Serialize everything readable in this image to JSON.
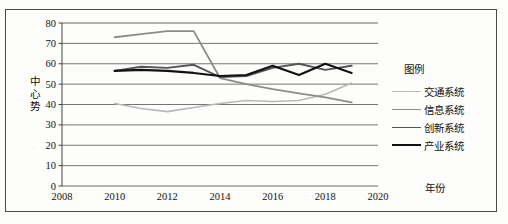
{
  "chart_data": {
    "type": "line",
    "title": "",
    "xlabel": "年份",
    "ylabel": "中心势",
    "xlim": [
      2008,
      2020
    ],
    "ylim": [
      0,
      80
    ],
    "xticks": [
      "2008",
      "2010",
      "2012",
      "2014",
      "2016",
      "2018",
      "2020"
    ],
    "yticks": [
      "0",
      "10",
      "20",
      "30",
      "40",
      "50",
      "60",
      "70",
      "80"
    ],
    "grid": true,
    "legend_position": "right",
    "legend_title": "图例",
    "x": [
      2010,
      2011,
      2012,
      2013,
      2014,
      2015,
      2016,
      2017,
      2018,
      2019
    ],
    "series": [
      {
        "name": "交通系统",
        "color": "#b8b8b8",
        "width": 1.6,
        "values": [
          40.5,
          38.0,
          36.5,
          38.5,
          40.5,
          42.0,
          41.5,
          42.0,
          45.0,
          50.5
        ]
      },
      {
        "name": "信息系统",
        "color": "#8c8c8c",
        "width": 1.8,
        "values": [
          73.0,
          74.5,
          76.0,
          76.0,
          53.0,
          50.0,
          47.5,
          45.5,
          43.5,
          41.0
        ]
      },
      {
        "name": "创新系统",
        "color": "#555555",
        "width": 1.9,
        "values": [
          56.5,
          58.5,
          58.0,
          59.5,
          53.5,
          54.0,
          58.0,
          60.0,
          57.0,
          59.0
        ]
      },
      {
        "name": "产业系统",
        "color": "#111111",
        "width": 2.1,
        "values": [
          56.5,
          57.0,
          56.5,
          55.5,
          54.0,
          54.5,
          59.0,
          54.5,
          60.0,
          55.5
        ]
      }
    ]
  }
}
